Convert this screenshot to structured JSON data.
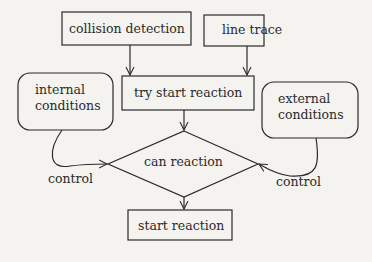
{
  "nodes": {
    "collision_detection": "collision detection",
    "line_trace": "line trace",
    "try_start_reaction": "try start reaction",
    "internal_conditions": [
      "internal",
      "conditions"
    ],
    "external_conditions": [
      "external",
      "conditions"
    ],
    "can_reaction": "can reaction",
    "start_reaction": "start reaction"
  },
  "edges": {
    "control_left": "control",
    "control_right": "control"
  },
  "colors": {
    "stroke": "#2a2a2a",
    "background": "#f4f3f0"
  }
}
